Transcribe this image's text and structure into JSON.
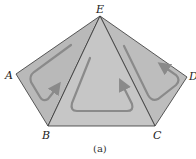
{
  "figure": {
    "caption": "(a)",
    "vertices": {
      "A": {
        "label": "A",
        "x": 16,
        "y": 74
      },
      "B": {
        "label": "B",
        "x": 48,
        "y": 126
      },
      "C": {
        "label": "C",
        "x": 155,
        "y": 126
      },
      "D": {
        "label": "D",
        "x": 187,
        "y": 77
      },
      "E": {
        "label": "E",
        "x": 100,
        "y": 16
      }
    },
    "regions": [
      {
        "name": "triangle-ABE",
        "vertices": [
          "A",
          "B",
          "E"
        ],
        "fill": "#b9b9b9",
        "arrow": "circulation-loop"
      },
      {
        "name": "triangle-BCE",
        "vertices": [
          "B",
          "C",
          "E"
        ],
        "fill": "#c6c6c6",
        "arrow": "circulation-loop"
      },
      {
        "name": "triangle-CDE",
        "vertices": [
          "C",
          "D",
          "E"
        ],
        "fill": "#bdbdbd",
        "arrow": "circulation-loop"
      }
    ],
    "colors": {
      "edge": "#333333",
      "arrow": "#8a8a8a"
    }
  }
}
